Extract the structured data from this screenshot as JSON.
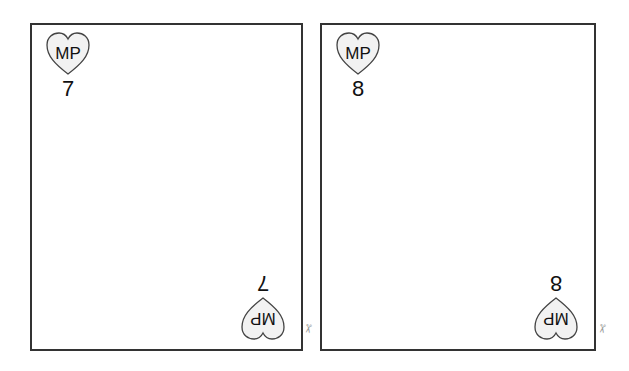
{
  "cards": [
    {
      "badge": "MP",
      "rank": "7"
    },
    {
      "badge": "MP",
      "rank": "8"
    }
  ],
  "icons": {
    "heart": "heart-icon",
    "scissors": "✂"
  },
  "colors": {
    "border": "#333333",
    "heart_fill": "#f2f2f2",
    "heart_stroke": "#444444"
  }
}
